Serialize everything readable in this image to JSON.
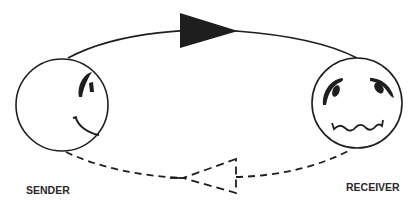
{
  "diagram": {
    "type": "communication-loop",
    "colors": {
      "stroke": "#1e1e1e",
      "background": "#ffffff"
    },
    "nodes": [
      {
        "id": "sender",
        "label": "SENDER",
        "expression": "smiling-profile"
      },
      {
        "id": "receiver",
        "label": "RECEIVER",
        "expression": "worried-frown"
      }
    ],
    "edges": [
      {
        "from": "sender",
        "to": "receiver",
        "style": "solid",
        "arrow": "filled-triangle",
        "path": "top-arc"
      },
      {
        "from": "receiver",
        "to": "sender",
        "style": "dashed",
        "arrow": "hollow-dashed-triangle",
        "path": "bottom-arc"
      }
    ]
  },
  "labels": {
    "sender": "SENDER",
    "receiver": "RECEIVER"
  }
}
